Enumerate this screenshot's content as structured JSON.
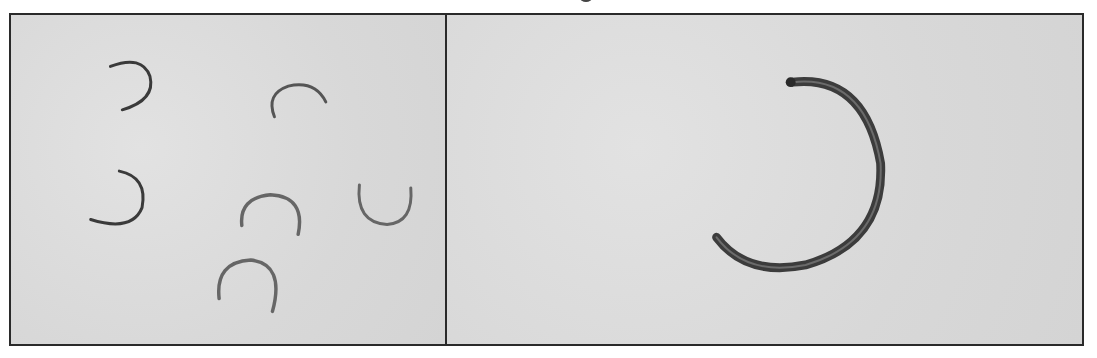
{
  "figure": {
    "panels": [
      {
        "id": "left",
        "content": "six small C-rings scattered on light gray background",
        "ring_count": 6
      },
      {
        "id": "right",
        "content": "single enlarged corroded C-ring",
        "ring_count": 1
      }
    ],
    "colors": {
      "background": "#dcdcdc",
      "border": "#2a2a2a",
      "ring_dark": "#3a3a3a",
      "ring_light": "#7a7a7a"
    }
  }
}
